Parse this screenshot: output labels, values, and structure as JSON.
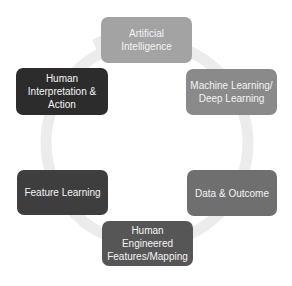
{
  "diagram": {
    "type": "cycle",
    "ring_color": "#ececec",
    "nodes": [
      {
        "id": "ai",
        "label": "Artificial Intelligence",
        "lines": [
          "Artificial",
          "Intelligence"
        ],
        "color": "#a3a3a3"
      },
      {
        "id": "ml",
        "label": "Machine Learning/ Deep Learning",
        "lines": [
          "Machine Learning/",
          "Deep Learning"
        ],
        "color": "#8a8a8a"
      },
      {
        "id": "data",
        "label": "Data & Outcome",
        "lines": [
          "Data & Outcome"
        ],
        "color": "#6f6f6f"
      },
      {
        "id": "hef",
        "label": "Human Engineered Features/Mapping",
        "lines": [
          "Human Engineered",
          "Features/Mapping"
        ],
        "color": "#565656"
      },
      {
        "id": "fl",
        "label": "Feature Learning",
        "lines": [
          "Feature Learning"
        ],
        "color": "#3e3e3e"
      },
      {
        "id": "hia",
        "label": "Human Interpretation & Action",
        "lines": [
          "Human",
          "Interpretation &",
          "Action"
        ],
        "color": "#2c2c2c"
      }
    ]
  }
}
